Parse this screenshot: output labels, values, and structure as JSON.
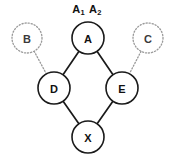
{
  "diagram": {
    "type": "lattice-graph",
    "title": {
      "full_text": "A1 A2",
      "term_1_base": "A",
      "term_1_sub": "1",
      "term_2_base": "A",
      "term_2_sub": "2"
    },
    "canvas": {
      "width": 174,
      "height": 157,
      "background_color": "#ffffff"
    },
    "colors": {
      "solid_stroke": "#1a1a1a",
      "dotted_stroke": "#9a9a9a",
      "node_fill": "#ffffff",
      "label_color": "#111111"
    },
    "nodes": [
      {
        "id": "A",
        "label": "A",
        "cx": 88,
        "cy": 38,
        "r": 16,
        "style": "solid"
      },
      {
        "id": "B",
        "label": "B",
        "cx": 27,
        "cy": 38,
        "r": 15,
        "style": "dotted"
      },
      {
        "id": "C",
        "label": "C",
        "cx": 148,
        "cy": 38,
        "r": 15,
        "style": "dotted"
      },
      {
        "id": "D",
        "label": "D",
        "cx": 54,
        "cy": 88,
        "r": 16,
        "style": "solid"
      },
      {
        "id": "E",
        "label": "E",
        "cx": 122,
        "cy": 88,
        "r": 16,
        "style": "solid"
      },
      {
        "id": "X",
        "label": "X",
        "cx": 88,
        "cy": 137,
        "r": 16,
        "style": "solid"
      }
    ],
    "edges": [
      {
        "from": "A",
        "to": "D",
        "style": "solid"
      },
      {
        "from": "A",
        "to": "E",
        "style": "solid"
      },
      {
        "from": "D",
        "to": "X",
        "style": "solid"
      },
      {
        "from": "E",
        "to": "X",
        "style": "solid"
      },
      {
        "from": "B",
        "to": "D",
        "style": "dotted"
      },
      {
        "from": "C",
        "to": "E",
        "style": "dotted"
      }
    ]
  }
}
